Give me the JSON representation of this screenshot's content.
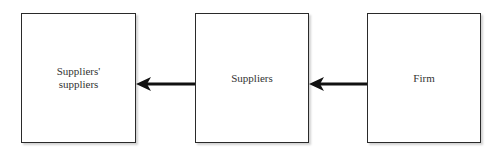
{
  "diagram": {
    "type": "flow",
    "direction": "right-to-left",
    "nodes": [
      {
        "id": "suppliers-suppliers",
        "label_line1": "Suppliers'",
        "label_line2": "suppliers"
      },
      {
        "id": "suppliers",
        "label": "Suppliers"
      },
      {
        "id": "firm",
        "label": "Firm"
      }
    ],
    "edges": [
      {
        "from": "firm",
        "to": "suppliers"
      },
      {
        "from": "suppliers",
        "to": "suppliers-suppliers"
      }
    ],
    "colors": {
      "border": "#2a2a2a",
      "arrow": "#111111",
      "text": "#333333",
      "background": "#ffffff"
    }
  }
}
